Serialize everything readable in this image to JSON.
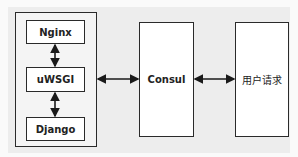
{
  "diagram": {
    "title": "",
    "nodes": [
      {
        "id": "server-group",
        "label": "",
        "type": "container"
      },
      {
        "id": "nginx",
        "label": "Nginx",
        "parent": "server-group"
      },
      {
        "id": "uwsgi",
        "label": "uWSGI",
        "parent": "server-group"
      },
      {
        "id": "django",
        "label": "Django",
        "parent": "server-group"
      },
      {
        "id": "consul",
        "label": "Consul"
      },
      {
        "id": "user-request",
        "label": "用户请求"
      }
    ],
    "edges": [
      {
        "from": "nginx",
        "to": "uwsgi",
        "direction": "bidirectional"
      },
      {
        "from": "uwsgi",
        "to": "django",
        "direction": "bidirectional"
      },
      {
        "from": "server-group",
        "to": "consul",
        "direction": "bidirectional"
      },
      {
        "from": "consul",
        "to": "user-request",
        "direction": "bidirectional"
      }
    ],
    "colors": {
      "stroke": "#2a2a2a",
      "box_fill": "#ffffff",
      "background": "#ededed"
    }
  }
}
